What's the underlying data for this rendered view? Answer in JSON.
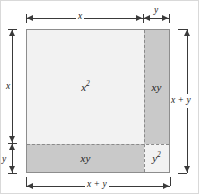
{
  "figure": {
    "colors": {
      "light_region": "#f2f2f2",
      "dark_region": "#c9c9c9",
      "outline": "#8d8d8d",
      "dashed_divider": "#8a8a8a",
      "dimension_line": "#3a3a3a",
      "page_border": "#d9d9d9",
      "background": "#ffffff"
    }
  },
  "regions": {
    "top_left": {
      "label": "x",
      "exponent": "2",
      "shade": "light"
    },
    "top_right": {
      "label": "xy",
      "exponent": "",
      "shade": "dark"
    },
    "bottom_left": {
      "label": "xy",
      "exponent": "",
      "shade": "dark"
    },
    "bottom_right": {
      "label": "y",
      "exponent": "2",
      "shade": "light"
    }
  },
  "dimensions": {
    "top_left_segment": "x",
    "top_right_segment": "y",
    "left_upper_segment": "x",
    "left_lower_segment": "y",
    "right_total": "x + y",
    "bottom_total": "x + y"
  }
}
